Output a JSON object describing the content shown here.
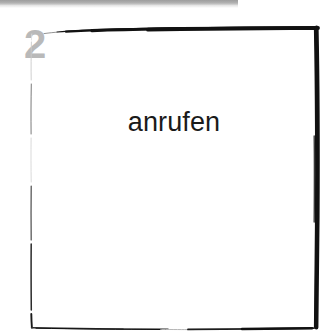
{
  "canvas": {
    "width": 333,
    "height": 331,
    "background_color": "#ffffff"
  },
  "top_bar": {
    "name": "top-divider-bar",
    "color": "#a9a9a9",
    "width_px": 238,
    "height_px": 5
  },
  "step": {
    "number": "2",
    "color": "#b9b9b9"
  },
  "box": {
    "label": "anrufen",
    "stroke_color": "#111111",
    "fill_color": "#ffffff",
    "style": "hand-drawn-sketch"
  }
}
